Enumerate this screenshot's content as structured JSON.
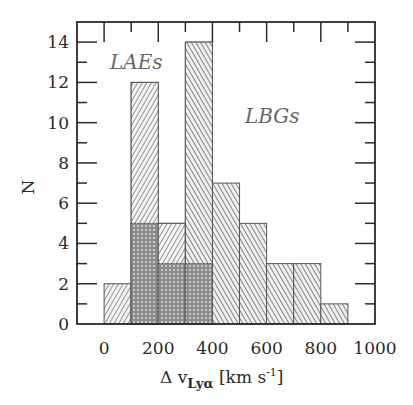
{
  "chart_data": {
    "type": "bar",
    "subtype": "histogram",
    "title": "",
    "xlabel": "Δ v_Lyα [km s^-1]",
    "ylabel": "N",
    "xlim": [
      -100,
      1000
    ],
    "ylim": [
      0,
      15
    ],
    "grid": false,
    "legend": "none (in-plot text annotations)",
    "x_ticks": [
      0,
      200,
      400,
      600,
      800,
      1000
    ],
    "y_ticks": [
      0,
      2,
      4,
      6,
      8,
      10,
      12,
      14
    ],
    "bin_width": 100,
    "bin_edges": [
      0,
      100,
      200,
      300,
      400,
      500,
      600,
      700,
      800,
      900
    ],
    "categories": [
      "0-100",
      "100-200",
      "200-300",
      "300-400",
      "400-500",
      "500-600",
      "600-700",
      "700-800",
      "800-900"
    ],
    "series": [
      {
        "name": "LAEs",
        "hatch": "forward-diagonal light",
        "values": [
          2,
          12,
          5,
          3,
          0,
          0,
          0,
          0,
          0
        ]
      },
      {
        "name": "LBGs",
        "hatch": "backward-diagonal",
        "values": [
          0,
          5,
          3,
          14,
          7,
          5,
          3,
          3,
          1
        ]
      }
    ],
    "annotations": [
      {
        "text": "LAEs",
        "x": 50,
        "y": 13
      },
      {
        "text": "LBGs",
        "x": 600,
        "y": 10.5
      }
    ]
  },
  "labels": {
    "ylabel": "N",
    "xlabel_main": "Δ v",
    "xlabel_sub": "Lyα",
    "xlabel_units": " [km s",
    "xlabel_exp": "-1",
    "xlabel_close": "]",
    "annot_lae": "LAEs",
    "annot_lbg": "LBGs"
  },
  "colors": {
    "axis": "#2a2a2a",
    "bar_edge": "#555555",
    "hatch": "#555555",
    "overlap": "#555555",
    "annotation": "#666666"
  }
}
